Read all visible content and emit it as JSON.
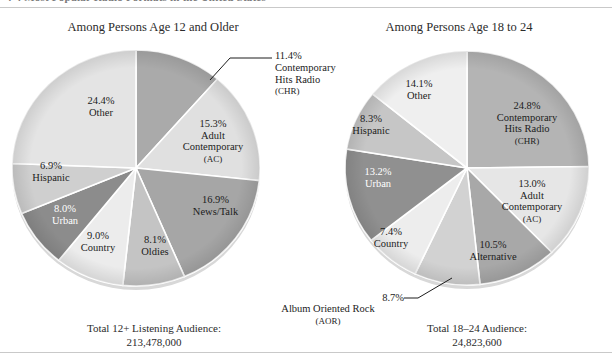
{
  "figure": {
    "clipped_header": "4-4  Most Popular Radio Formats in the United States",
    "left": {
      "title": "Among Persons Age 12 and Older",
      "total_caption": "Total 12+ Listening Audience:",
      "total_value": "213,478,000"
    },
    "right": {
      "title": "Among Persons Age 18 to 24",
      "total_caption": "Total 18–24 Audience:",
      "total_value": "24,823,600"
    }
  },
  "chart_data": [
    {
      "type": "pie",
      "id": "age-12-plus",
      "title": "Among Persons Age 12 and Older",
      "total_label": "Total 12+ Listening Audience:",
      "total_value": "213,478,000",
      "categories": [
        "Contemporary Hits Radio (CHR)",
        "Adult Contemporary (AC)",
        "News/Talk",
        "Oldies",
        "Country",
        "Urban",
        "Hispanic",
        "Other"
      ],
      "values": [
        11.4,
        15.3,
        16.9,
        8.1,
        9.0,
        8.0,
        6.9,
        24.4
      ],
      "slices": [
        {
          "pct": "11.4%",
          "name": "Contemporary",
          "name2": "Hits Radio",
          "abbr": "(CHR)",
          "value": 11.4,
          "color": "#aaaaaa",
          "label_style": "callout"
        },
        {
          "pct": "15.3%",
          "name": "Adult",
          "name2": "Contemporary",
          "abbr": "(AC)",
          "value": 15.3,
          "color": "#e0e0e0",
          "label_style": "inside-dark"
        },
        {
          "pct": "16.9%",
          "name": "News/Talk",
          "name2": "",
          "abbr": "",
          "value": 16.9,
          "color": "#a6a6a6",
          "label_style": "inside-dark"
        },
        {
          "pct": "8.1%",
          "name": "Oldies",
          "name2": "",
          "abbr": "",
          "value": 8.1,
          "color": "#c4c4c4",
          "label_style": "inside-dark"
        },
        {
          "pct": "9.0%",
          "name": "Country",
          "name2": "",
          "abbr": "",
          "value": 9.0,
          "color": "#ececec",
          "label_style": "inside-dark"
        },
        {
          "pct": "8.0%",
          "name": "Urban",
          "name2": "",
          "abbr": "",
          "value": 8.0,
          "color": "#8c8c8c",
          "label_style": "inside-light"
        },
        {
          "pct": "6.9%",
          "name": "Hispanic",
          "name2": "",
          "abbr": "",
          "value": 6.9,
          "color": "#cfcfcf",
          "label_style": "inside-dark"
        },
        {
          "pct": "24.4%",
          "name": "Other",
          "name2": "",
          "abbr": "",
          "value": 24.4,
          "color": "#e4e4e4",
          "label_style": "inside-dark"
        }
      ]
    },
    {
      "type": "pie",
      "id": "age-18-24",
      "title": "Among Persons Age 18 to 24",
      "total_label": "Total 18–24 Audience:",
      "total_value": "24,823,600",
      "categories": [
        "Contemporary Hits Radio (CHR)",
        "Adult Contemporary (AC)",
        "Alternative",
        "Album Oriented Rock (AOR)",
        "Country",
        "Urban",
        "Hispanic",
        "Other"
      ],
      "values": [
        24.8,
        13.0,
        10.5,
        8.7,
        7.4,
        13.2,
        8.3,
        14.1
      ],
      "slices": [
        {
          "pct": "24.8%",
          "name": "Contemporary",
          "name2": "Hits Radio",
          "abbr": "(CHR)",
          "value": 24.8,
          "color": "#b4b4b4",
          "label_style": "inside-dark"
        },
        {
          "pct": "13.0%",
          "name": "Adult",
          "name2": "Contemporary",
          "abbr": "(AC)",
          "value": 13.0,
          "color": "#e6e6e6",
          "label_style": "inside-dark"
        },
        {
          "pct": "10.5%",
          "name": "Alternative",
          "name2": "",
          "abbr": "",
          "value": 10.5,
          "color": "#a8a8a8",
          "label_style": "inside-dark"
        },
        {
          "pct": "8.7%",
          "name": "Album Oriented Rock",
          "name2": "",
          "abbr": "(AOR)",
          "value": 8.7,
          "color": "#d2d2d2",
          "label_style": "callout"
        },
        {
          "pct": "7.4%",
          "name": "Country",
          "name2": "",
          "abbr": "",
          "value": 7.4,
          "color": "#ededed",
          "label_style": "inside-dark"
        },
        {
          "pct": "13.2%",
          "name": "Urban",
          "name2": "",
          "abbr": "",
          "value": 13.2,
          "color": "#909090",
          "label_style": "inside-light"
        },
        {
          "pct": "8.3%",
          "name": "Hispanic",
          "name2": "",
          "abbr": "",
          "value": 8.3,
          "color": "#c6c6c6",
          "label_style": "inside-dark"
        },
        {
          "pct": "14.1%",
          "name": "Other",
          "name2": "",
          "abbr": "",
          "value": 14.1,
          "color": "#efefef",
          "label_style": "inside-dark"
        }
      ],
      "callouts": [
        {
          "pct": "8.7%",
          "line1": "Album Oriented Rock",
          "line2": "(AOR)"
        }
      ]
    }
  ]
}
